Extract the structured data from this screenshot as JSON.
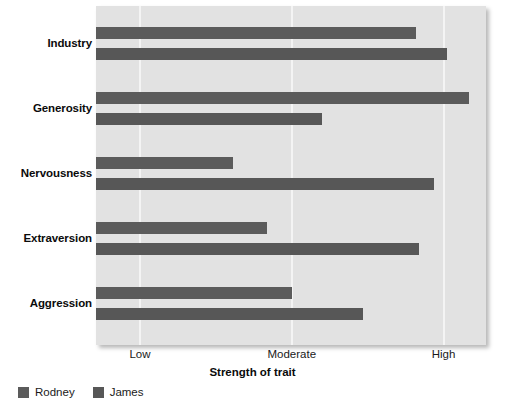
{
  "chart_data": {
    "type": "bar",
    "orientation": "horizontal",
    "title": "",
    "subtitle": "",
    "xlabel": "Strength of trait",
    "ylabel": "",
    "categories": [
      "Industry",
      "Generosity",
      "Nervousness",
      "Extraversion",
      "Aggression"
    ],
    "tick_labels": [
      "Low",
      "Moderate",
      "High"
    ],
    "tick_values": [
      1,
      2,
      3
    ],
    "xlim": [
      0.71,
      3.28
    ],
    "grid": true,
    "legend_position": "bottom-left",
    "series": [
      {
        "name": "Rodney",
        "color": "#5b5b5b",
        "values": [
          2.82,
          3.17,
          1.61,
          1.84,
          2.0
        ]
      },
      {
        "name": "James",
        "color": "#575757",
        "values": [
          3.02,
          2.2,
          2.94,
          2.84,
          2.47
        ]
      }
    ],
    "annotations": []
  },
  "style": {
    "plot_background": "#e2e2e2",
    "gridline_color": "#f4f4f4",
    "page_background": "#ffffff",
    "text_color": "#1a1a1a"
  },
  "legend": {
    "entries": [
      {
        "label": "Rodney",
        "swatch_name": "legend-swatch-rodney"
      },
      {
        "label": "James",
        "swatch_name": "legend-swatch-james"
      }
    ]
  },
  "axis": {
    "x_title": "Strength of trait"
  }
}
